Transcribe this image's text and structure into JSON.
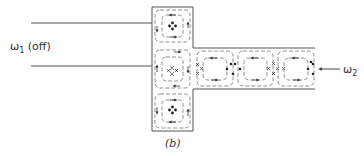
{
  "labels": {
    "omega1_symbol": "ω",
    "omega1_sub": "1",
    "omega1_note": " (off)",
    "omega2_symbol": "ω",
    "omega2_sub": "2",
    "panel": "(b)"
  },
  "figure": {
    "vertical_cells": [
      {
        "position": "top",
        "marker": "four-dot"
      },
      {
        "position": "middle",
        "marker": "four-cross"
      },
      {
        "position": "bottom",
        "marker": "four-dot"
      }
    ],
    "horizontal_cells": [
      {
        "position": "1",
        "marker": "none"
      },
      {
        "position": "2",
        "marker": "none"
      },
      {
        "position": "3",
        "marker": "none"
      }
    ],
    "colors": {
      "line": "#555555",
      "dash": "#777777",
      "marker": "#222222"
    }
  }
}
